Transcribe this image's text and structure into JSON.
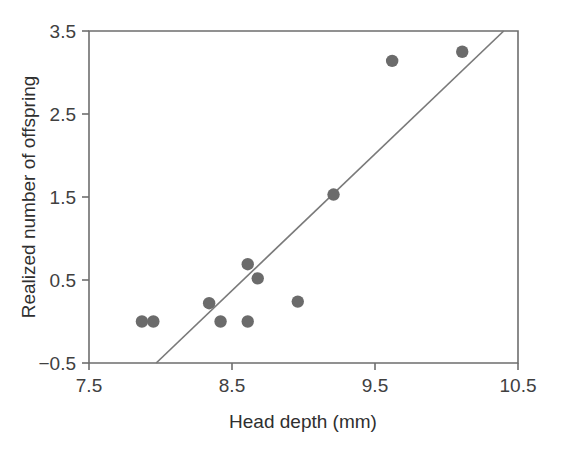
{
  "chart_data": {
    "type": "scatter",
    "title": "",
    "xlabel": "Head depth (mm)",
    "ylabel": "Realized number of offspring",
    "xlim": [
      7.5,
      10.5
    ],
    "ylim": [
      -0.5,
      3.5
    ],
    "xticks": [
      7.5,
      8.5,
      9.5,
      10.5
    ],
    "xtick_labels": [
      "7.5",
      "8.5",
      "9.5",
      "10.5"
    ],
    "yticks": [
      -0.5,
      0.5,
      1.5,
      2.5,
      3.5
    ],
    "ytick_labels": [
      "−0.5",
      "0.5",
      "1.5",
      "2.5",
      "3.5"
    ],
    "grid": false,
    "legend": null,
    "marker_color": "#6b6b6b",
    "line_color": "#7a7a7a",
    "frame_color": "#6e6e6e",
    "points": [
      {
        "x": 7.87,
        "y": 0.0
      },
      {
        "x": 7.95,
        "y": 0.0
      },
      {
        "x": 8.34,
        "y": 0.22
      },
      {
        "x": 8.42,
        "y": 0.0
      },
      {
        "x": 8.61,
        "y": 0.69
      },
      {
        "x": 8.68,
        "y": 0.52
      },
      {
        "x": 8.61,
        "y": 0.0
      },
      {
        "x": 8.96,
        "y": 0.24
      },
      {
        "x": 9.21,
        "y": 1.53
      },
      {
        "x": 9.62,
        "y": 3.14
      },
      {
        "x": 10.11,
        "y": 3.25
      }
    ],
    "fit_line": {
      "label": "regression line",
      "x_start": 7.97,
      "y_start": -0.5,
      "x_end": 10.4,
      "y_end": 3.5
    }
  },
  "axis": {
    "x_tick_0": "7.5",
    "x_tick_1": "8.5",
    "x_tick_2": "9.5",
    "x_tick_3": "10.5",
    "y_tick_0": "3.5",
    "y_tick_1": "2.5",
    "y_tick_2": "1.5",
    "y_tick_3": "0.5",
    "y_tick_4": "−0.5",
    "x_title": "Head depth (mm)",
    "y_title": "Realized number of offspring"
  }
}
